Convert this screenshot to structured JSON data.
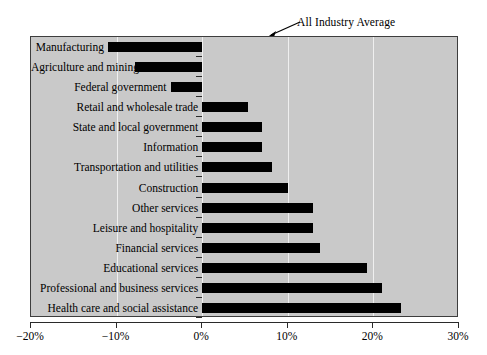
{
  "chart_data": {
    "type": "bar",
    "orientation": "horizontal",
    "title": "",
    "xlabel": "",
    "ylabel": "",
    "xlim": [
      -20,
      30
    ],
    "xticks": [
      -20,
      -10,
      0,
      10,
      20,
      30
    ],
    "xtick_labels": [
      "−20%",
      "−10%",
      "0%",
      "10%",
      "20%",
      "30%"
    ],
    "gridlines": [
      -10,
      0,
      10,
      20
    ],
    "grid": true,
    "legend": "none",
    "bar_color": "#000000",
    "plot_background": "#c9c9c9",
    "categories": [
      "Manufacturing",
      "Agriculture and mining",
      "Federal government",
      "Retail and wholesale trade",
      "State and local government",
      "Information",
      "Transportation and utilities",
      "Construction",
      "Other services",
      "Leisure and hospitality",
      "Financial services",
      "Educational services",
      "Professional and business services",
      "Health care and social assistance"
    ],
    "values": [
      -11.0,
      -7.8,
      -3.7,
      5.3,
      7.0,
      7.0,
      8.2,
      10.0,
      13.0,
      13.0,
      13.8,
      19.2,
      21.0,
      23.2
    ],
    "annotations": [
      {
        "text": "All Industry Average",
        "points_to_x": 10,
        "style": "arrow"
      }
    ]
  }
}
